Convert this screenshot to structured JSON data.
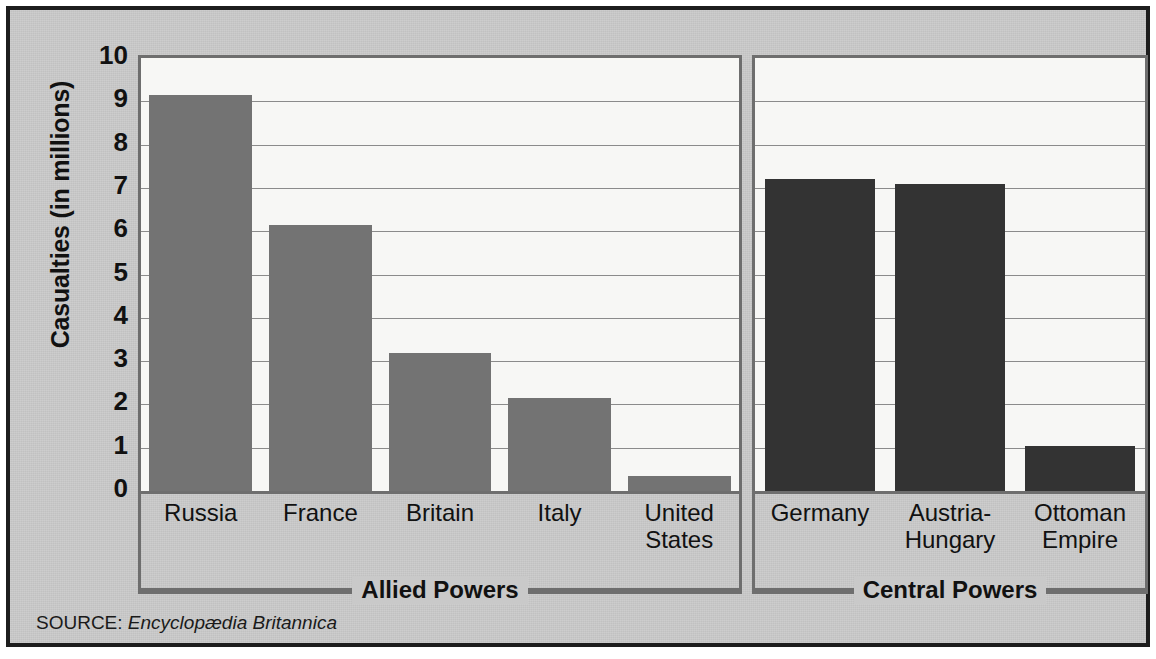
{
  "chart_data": {
    "type": "bar",
    "title": "",
    "xlabel": "",
    "ylabel": "Casualties (in millions)",
    "ylim": [
      0,
      10
    ],
    "ytick_labels": [
      "10",
      "9",
      "8",
      "7",
      "6",
      "5",
      "4",
      "3",
      "2",
      "1",
      "0"
    ],
    "ytick_values": [
      10,
      9,
      8,
      7,
      6,
      5,
      4,
      3,
      2,
      1,
      0
    ],
    "grid": true,
    "legend": "none",
    "groups": [
      {
        "name": "Allied Powers",
        "color": "#737373",
        "categories": [
          "Russia",
          "France",
          "Britain",
          "Italy",
          "United States"
        ],
        "values": [
          9.15,
          6.15,
          3.19,
          2.15,
          0.35
        ]
      },
      {
        "name": "Central Powers",
        "color": "#333333",
        "categories": [
          "Germany",
          "Austria-Hungary",
          "Ottoman Empire"
        ],
        "values": [
          7.2,
          7.1,
          1.05
        ]
      }
    ],
    "categories": [
      "Russia",
      "France",
      "Britain",
      "Italy",
      "United States",
      "Germany",
      "Austria-Hungary",
      "Ottoman Empire"
    ],
    "values": [
      9.15,
      6.15,
      3.19,
      2.15,
      0.35,
      7.2,
      7.1,
      1.05
    ]
  },
  "axis": {
    "y_title": "Casualties (in millions)",
    "ticks": [
      "10",
      "9",
      "8",
      "7",
      "6",
      "5",
      "4",
      "3",
      "2",
      "1",
      "0"
    ]
  },
  "allied": {
    "group_label": "Allied Powers",
    "categories": [
      {
        "line1": "Russia",
        "line2": ""
      },
      {
        "line1": "France",
        "line2": ""
      },
      {
        "line1": "Britain",
        "line2": ""
      },
      {
        "line1": "Italy",
        "line2": ""
      },
      {
        "line1": "United",
        "line2": "States"
      }
    ]
  },
  "central": {
    "group_label": "Central Powers",
    "categories": [
      {
        "line1": "Germany",
        "line2": ""
      },
      {
        "line1": "Austria-",
        "line2": "Hungary"
      },
      {
        "line1": "Ottoman",
        "line2": "Empire"
      }
    ]
  },
  "source": {
    "prefix": "SOURCE:",
    "name": "Encyclopædia Britannica"
  },
  "colors": {
    "panel_background": "#c9c9c9",
    "plot_background": "#f7f7f5",
    "frame": "#1d1d1d",
    "axis_line": "#6e6e6e",
    "gridline": "#8b8b8b",
    "allied_bar": "#737373",
    "central_bar": "#333333",
    "text": "#111111"
  }
}
